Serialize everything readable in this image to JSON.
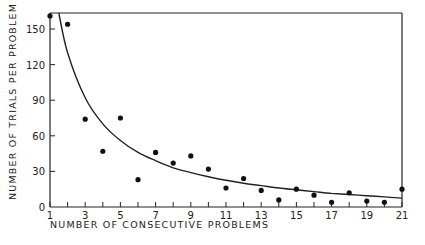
{
  "chart_data": {
    "type": "scatter",
    "title": "",
    "xlabel": "NUMBER OF CONSECUTIVE PROBLEMS",
    "ylabel": "NUMBER OF TRIALS PER PROBLEM",
    "xlim": [
      1,
      21
    ],
    "ylim": [
      0,
      165
    ],
    "x_ticks": [
      1,
      2,
      3,
      4,
      5,
      6,
      7,
      8,
      9,
      10,
      11,
      12,
      13,
      14,
      15,
      16,
      17,
      18,
      19,
      20,
      21
    ],
    "x_tick_labels": [
      "1",
      "3",
      "5",
      "7",
      "9",
      "11",
      "13",
      "15",
      "17",
      "19",
      "21"
    ],
    "x_tick_label_values": [
      1,
      3,
      5,
      7,
      9,
      11,
      13,
      15,
      17,
      19,
      21
    ],
    "y_ticks": [
      0,
      30,
      60,
      90,
      120,
      150
    ],
    "y_tick_labels": [
      "0",
      "30",
      "60",
      "90",
      "120",
      "150"
    ],
    "grid": false,
    "series": [
      {
        "name": "observed",
        "style": "points",
        "x": [
          1,
          2,
          3,
          4,
          5,
          6,
          7,
          8,
          9,
          10,
          11,
          12,
          13,
          14,
          15,
          16,
          17,
          18,
          19,
          20,
          21
        ],
        "y": [
          161,
          154,
          74,
          47,
          75,
          23,
          46,
          37,
          43,
          32,
          16,
          24,
          14,
          6,
          15,
          10,
          4,
          12,
          5,
          4,
          15
        ]
      },
      {
        "name": "fitted curve",
        "style": "line",
        "x": [
          1.5,
          2,
          3,
          4,
          5,
          6,
          7,
          8,
          9,
          10,
          11,
          12,
          13,
          14,
          15,
          16,
          17,
          18,
          19,
          20,
          21
        ],
        "y": [
          165,
          130,
          92,
          70,
          56,
          46,
          39,
          33,
          29,
          25.5,
          22.5,
          20,
          18,
          16,
          14.5,
          13,
          11.5,
          10.5,
          9.5,
          8.5,
          7.5
        ]
      }
    ]
  }
}
